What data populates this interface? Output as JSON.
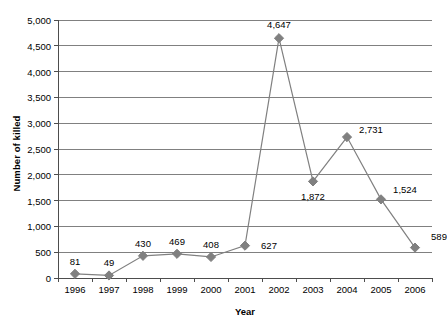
{
  "chart_data": {
    "type": "line",
    "title": "",
    "xlabel": "Year",
    "ylabel": "Number of killed",
    "categories": [
      "1996",
      "1997",
      "1998",
      "1999",
      "2000",
      "2001",
      "2002",
      "2003",
      "2004",
      "2005",
      "2006"
    ],
    "values": [
      81,
      49,
      430,
      469,
      408,
      627,
      4647,
      1872,
      2731,
      1524,
      589
    ],
    "data_labels": [
      "81",
      "49",
      "430",
      "469",
      "408",
      "627",
      "4,647",
      "1,872",
      "2,731",
      "1,524",
      "589"
    ],
    "ylim": [
      0,
      5000
    ],
    "ytick_values": [
      0,
      500,
      1000,
      1500,
      2000,
      2500,
      3000,
      3500,
      4000,
      4500,
      5000
    ],
    "ytick_labels": [
      "0",
      "500",
      "1,000",
      "1,500",
      "2,000",
      "2,500",
      "3,000",
      "3,500",
      "4,000",
      "4,500",
      "5,000"
    ],
    "grid": "horizontal",
    "legend": "none",
    "series": [
      {
        "name": "Number of killed",
        "values": [
          81,
          49,
          430,
          469,
          408,
          627,
          4647,
          1872,
          2731,
          1524,
          589
        ],
        "marker": "diamond",
        "line_color": "#808080",
        "marker_color": "#808080"
      }
    ],
    "colors": {
      "line": "#808080",
      "marker": "#808080",
      "grid": "#808080",
      "axis": "#4d4d4d",
      "text": "#000000",
      "background": "#ffffff"
    },
    "label_offsets": [
      {
        "dx": 0,
        "dy": -13
      },
      {
        "dx": 0,
        "dy": -13
      },
      {
        "dx": 0,
        "dy": -13
      },
      {
        "dx": 0,
        "dy": -13
      },
      {
        "dx": 0,
        "dy": -13
      },
      {
        "dx": 24,
        "dy": -1
      },
      {
        "dx": 0,
        "dy": -14
      },
      {
        "dx": 0,
        "dy": 15
      },
      {
        "dx": 24,
        "dy": -8
      },
      {
        "dx": 24,
        "dy": -10
      },
      {
        "dx": 24,
        "dy": -12
      }
    ]
  }
}
